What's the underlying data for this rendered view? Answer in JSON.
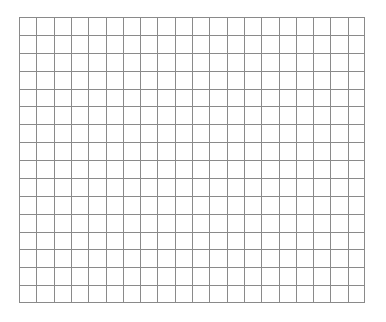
{
  "grid": {
    "columns": 20,
    "rows": 16,
    "left": 19,
    "top": 17,
    "width": 346,
    "height": 286,
    "line_color": "#8a8a8a",
    "background": "#ffffff"
  }
}
